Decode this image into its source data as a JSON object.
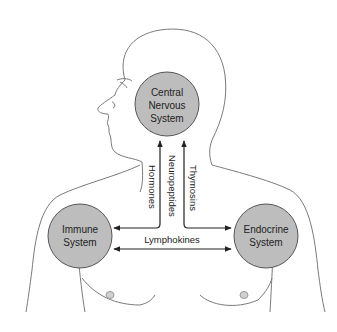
{
  "diagram": {
    "colors": {
      "outline": "#7a7a7a",
      "node_fill": "#bdbdbd",
      "node_stroke": "#555555",
      "arrow": "#222222",
      "text": "#222222"
    },
    "nodes": [
      {
        "id": "cns",
        "line1": "Central",
        "line2": "Nervous",
        "line3": "System"
      },
      {
        "id": "immune",
        "line1": "Immune",
        "line2": "System"
      },
      {
        "id": "endocrine",
        "line1": "Endocrine",
        "line2": "System"
      }
    ],
    "edges": [
      {
        "label": "Hormones",
        "from": "immune",
        "to": "cns",
        "direction": "bidirectional"
      },
      {
        "label": "Neuropeptides",
        "from": "cns",
        "to": "immune/endocrine"
      },
      {
        "label": "Thymosins",
        "from": "endocrine",
        "to": "cns",
        "direction": "bidirectional"
      },
      {
        "label": "Lymphokines",
        "from": "immune",
        "to": "endocrine",
        "direction": "bidirectional"
      }
    ]
  }
}
